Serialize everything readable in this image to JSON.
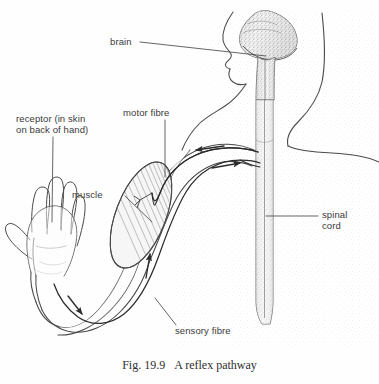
{
  "figure": {
    "caption_number": "Fig. 19.9",
    "caption_title": "A reflex pathway",
    "background_color": "#fefefe",
    "ink_color": "#3a3a3a"
  },
  "labels": {
    "brain": "brain",
    "motor_fibre": "motor fibre",
    "receptor_line1": "receptor (in skin",
    "receptor_line2": "on back of hand)",
    "muscle": "muscle",
    "spinal_line1": "spinal",
    "spinal_line2": "cord",
    "sensory_fibre": "sensory fibre"
  },
  "diagram_parts": {
    "head_profile": "head-profile-facing-left",
    "brain_mass": "stippled-brain-and-brainstem",
    "spinal_cord": "vertical-stippled-spinal-column",
    "shoulder": "shoulder-and-neck-outline",
    "upper_arm": "upper-arm-outline",
    "biceps_muscle": "striated-elliptical-muscle",
    "forearm": "forearm-outline",
    "hand": "hand-with-four-fingers-and-thumb",
    "motor_nerve": "upper-nerve-fibre-to-muscle",
    "sensory_nerve": "lower-nerve-fibre-from-hand"
  },
  "arrows": {
    "motor_shoulder": "left-pointing-arrow-on-motor-fibre",
    "sensory_shoulder": "right-pointing-arrow-on-sensory-fibre",
    "motor_upper_arm": "up-pointing-arrow-toward-muscle",
    "sensory_forearm": "down-left-pointing-arrow-along-forearm"
  }
}
